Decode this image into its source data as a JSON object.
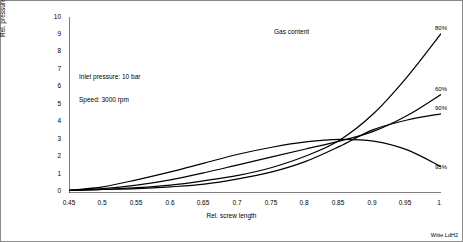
{
  "chart_data": {
    "type": "line",
    "title": "",
    "xlabel": "Rel. screw length",
    "ylabel": "Rel. pressure increase per length",
    "xlim": [
      0.45,
      1.0
    ],
    "ylim": [
      0,
      10
    ],
    "grid": false,
    "legend_position": "right-inline",
    "xticks": [
      "0.45",
      "0.5",
      "0.55",
      "0.6",
      "0.65",
      "0.7",
      "0.75",
      "0.8",
      "0.85",
      "0.9",
      "0.95",
      "1"
    ],
    "yticks": [
      "0",
      "1",
      "2",
      "3",
      "4",
      "5",
      "6",
      "7",
      "8",
      "9",
      "10"
    ],
    "x": [
      0.45,
      0.5,
      0.55,
      0.6,
      0.65,
      0.7,
      0.75,
      0.8,
      0.85,
      0.9,
      0.95,
      1.0
    ],
    "series": [
      {
        "name": "80%",
        "label": "80%",
        "values": [
          0.15,
          0.2,
          0.3,
          0.45,
          0.7,
          1.0,
          1.45,
          2.1,
          3.0,
          4.5,
          6.6,
          9.05
        ]
      },
      {
        "name": "60%",
        "label": "60%",
        "values": [
          0.15,
          0.25,
          0.45,
          0.75,
          1.15,
          1.6,
          2.05,
          2.5,
          2.95,
          3.5,
          4.4,
          5.6
        ]
      },
      {
        "name": "90%",
        "label": "90%",
        "values": [
          0.15,
          0.2,
          0.25,
          0.35,
          0.5,
          0.8,
          1.2,
          1.8,
          2.65,
          3.6,
          4.15,
          4.5
        ]
      },
      {
        "name": "95%",
        "label": "95%",
        "values": [
          0.15,
          0.35,
          0.75,
          1.2,
          1.7,
          2.2,
          2.6,
          2.9,
          3.05,
          2.95,
          2.45,
          1.5
        ]
      }
    ],
    "annotations": [
      {
        "name": "gas-content-annotation",
        "text": "Gas content"
      },
      {
        "name": "inlet-pressure-annotation",
        "text": "Inlet pressure: 10 bar"
      },
      {
        "name": "speed-annotation",
        "text": "Speed: 3000 rpm"
      }
    ],
    "corner_note": "Witte LdH2"
  }
}
